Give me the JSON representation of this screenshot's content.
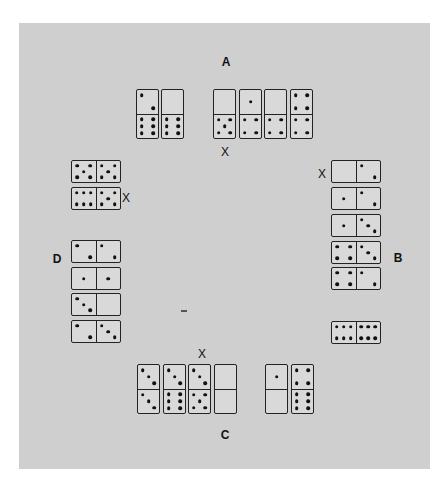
{
  "board": {
    "background": "#cfcfcf"
  },
  "labels": {
    "A": {
      "text": "A",
      "x": 226,
      "y": 62
    },
    "B": {
      "text": "B",
      "x": 398,
      "y": 258
    },
    "C": {
      "text": "C",
      "x": 225,
      "y": 435
    },
    "D": {
      "text": "D",
      "x": 57,
      "y": 259
    }
  },
  "x_marks": [
    {
      "text": "X",
      "x": 221,
      "y": 146,
      "near": "A hand, domino 0|5"
    },
    {
      "text": "X",
      "x": 122,
      "y": 192,
      "near": "D hand, domino 6|5"
    },
    {
      "text": "X",
      "x": 318,
      "y": 168,
      "near": "B hand, domino 0|2"
    },
    {
      "text": "X",
      "x": 198,
      "y": 348,
      "near": "C hand, domino 3|5"
    }
  ],
  "hands": {
    "A": {
      "label": "A",
      "dominoes": [
        {
          "a": 2,
          "b": 6,
          "x": 136,
          "y": 89,
          "o": "v"
        },
        {
          "a": 0,
          "b": 6,
          "x": 161,
          "y": 89,
          "o": "v"
        },
        {
          "a": 0,
          "b": 5,
          "x": 213,
          "y": 89,
          "o": "v",
          "marked": true
        },
        {
          "a": 1,
          "b": 4,
          "x": 239,
          "y": 89,
          "o": "v"
        },
        {
          "a": 0,
          "b": 4,
          "x": 264,
          "y": 89,
          "o": "v"
        },
        {
          "a": 4,
          "b": 4,
          "x": 290,
          "y": 89,
          "o": "v"
        }
      ]
    },
    "B": {
      "label": "B",
      "dominoes": [
        {
          "a": 0,
          "b": 2,
          "x": 331,
          "y": 160,
          "o": "h",
          "marked": true
        },
        {
          "a": 1,
          "b": 2,
          "x": 331,
          "y": 187,
          "o": "h"
        },
        {
          "a": 1,
          "b": 3,
          "x": 331,
          "y": 214,
          "o": "h"
        },
        {
          "a": 4,
          "b": 3,
          "x": 331,
          "y": 241,
          "o": "h"
        },
        {
          "a": 4,
          "b": 2,
          "x": 331,
          "y": 267,
          "o": "h"
        },
        {
          "a": 6,
          "b": 6,
          "x": 331,
          "y": 321,
          "o": "h"
        }
      ]
    },
    "C": {
      "label": "C",
      "dominoes": [
        {
          "a": 3,
          "b": 3,
          "x": 137,
          "y": 364,
          "o": "v"
        },
        {
          "a": 3,
          "b": 6,
          "x": 163,
          "y": 364,
          "o": "v"
        },
        {
          "a": 3,
          "b": 5,
          "x": 188,
          "y": 364,
          "o": "v",
          "marked": true
        },
        {
          "a": 0,
          "b": 0,
          "x": 214,
          "y": 364,
          "o": "v"
        },
        {
          "a": 1,
          "b": 0,
          "x": 265,
          "y": 364,
          "o": "v"
        },
        {
          "a": 4,
          "b": 6,
          "x": 291,
          "y": 364,
          "o": "v"
        }
      ]
    },
    "D": {
      "label": "D",
      "dominoes": [
        {
          "a": 5,
          "b": 5,
          "x": 71,
          "y": 160,
          "o": "h"
        },
        {
          "a": 6,
          "b": 5,
          "x": 71,
          "y": 187,
          "o": "h",
          "marked": true
        },
        {
          "a": 2,
          "b": 2,
          "x": 71,
          "y": 240,
          "o": "h"
        },
        {
          "a": 1,
          "b": 1,
          "x": 71,
          "y": 267,
          "o": "h"
        },
        {
          "a": 3,
          "b": 0,
          "x": 71,
          "y": 293,
          "o": "h"
        },
        {
          "a": 2,
          "b": 3,
          "x": 71,
          "y": 320,
          "o": "h"
        }
      ]
    }
  }
}
